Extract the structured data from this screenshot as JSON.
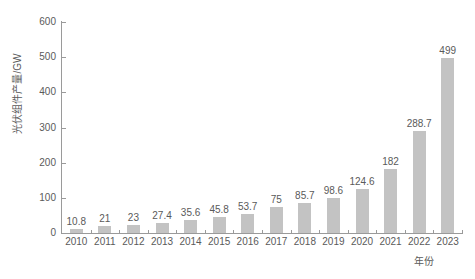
{
  "chart_data": {
    "type": "bar",
    "title": "",
    "subtitle": "",
    "xlabel": "年份",
    "ylabel": "光伏组件产量/GW",
    "categories": [
      "2010",
      "2011",
      "2012",
      "2013",
      "2014",
      "2015",
      "2016",
      "2017",
      "2018",
      "2019",
      "2020",
      "2021",
      "2022",
      "2023"
    ],
    "values": [
      10.8,
      21,
      23,
      27.4,
      35.6,
      45.8,
      53.7,
      75,
      85.7,
      98.6,
      124.6,
      182,
      288.7,
      499
    ],
    "value_labels": [
      "10.8",
      "21",
      "23",
      "27.4",
      "35.6",
      "45.8",
      "53.7",
      "75",
      "85.7",
      "98.6",
      "124.6",
      "182",
      "288.7",
      "499"
    ],
    "ylim": [
      0,
      600
    ],
    "yticks": [
      0,
      100,
      200,
      300,
      400,
      500,
      600
    ],
    "ytick_labels": [
      "0",
      "100",
      "200",
      "300",
      "400",
      "500",
      "600"
    ],
    "grid": false,
    "legend": false,
    "bar_color": "#c3c3c3",
    "axis_color": "#9a9a9a",
    "text_color": "#5a5a5a",
    "background_color": "#ffffff"
  }
}
